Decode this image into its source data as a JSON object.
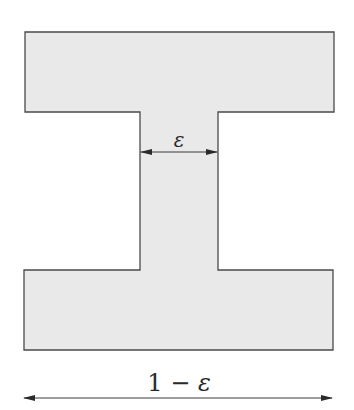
{
  "diagram": {
    "type": "i-beam-cross-section",
    "shape": {
      "fill_color": "#e9e9e9",
      "stroke_color": "#4a4a4a",
      "top_flange": {
        "x": 25,
        "y": 32,
        "width": 309,
        "height": 80
      },
      "web": {
        "x": 140,
        "y": 112,
        "width": 78,
        "height": 158
      },
      "bottom_flange": {
        "x": 24,
        "y": 270,
        "width": 309,
        "height": 80
      }
    },
    "dimensions": {
      "web_width": {
        "label": "ε",
        "y": 152,
        "x_start": 140,
        "x_end": 218
      },
      "total_width": {
        "label_number": "1",
        "label_operator": " − ",
        "label_symbol": "ε",
        "y": 398,
        "x_start": 24,
        "x_end": 332
      }
    }
  }
}
